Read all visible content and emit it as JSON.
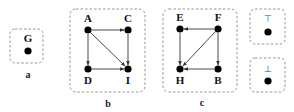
{
  "diagram": {
    "panels": [
      {
        "id": "a",
        "caption": "a",
        "nodes": [
          {
            "label": "G"
          }
        ],
        "edges": []
      },
      {
        "id": "b",
        "caption": "b",
        "nodes": [
          {
            "label": "A"
          },
          {
            "label": "C"
          },
          {
            "label": "D"
          },
          {
            "label": "I"
          }
        ],
        "edges": [
          {
            "from": "A",
            "to": "C"
          },
          {
            "from": "A",
            "to": "D"
          },
          {
            "from": "A",
            "to": "I"
          },
          {
            "from": "C",
            "to": "I"
          },
          {
            "from": "D",
            "to": "I"
          }
        ]
      },
      {
        "id": "c",
        "caption": "c",
        "nodes": [
          {
            "label": "E"
          },
          {
            "label": "F"
          },
          {
            "label": "H"
          },
          {
            "label": "B"
          }
        ],
        "edges": [
          {
            "from": "F",
            "to": "E"
          },
          {
            "from": "E",
            "to": "H"
          },
          {
            "from": "F",
            "to": "H"
          },
          {
            "from": "F",
            "to": "B"
          },
          {
            "from": "B",
            "to": "H"
          }
        ]
      },
      {
        "id": "top",
        "nodes": [
          {
            "label": "⊤"
          }
        ],
        "edges": []
      },
      {
        "id": "bottom",
        "nodes": [
          {
            "label": "⊥"
          }
        ],
        "edges": []
      }
    ]
  }
}
